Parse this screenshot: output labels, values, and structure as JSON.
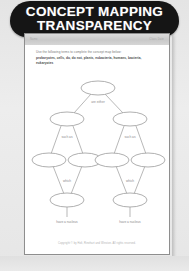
{
  "banner": {
    "title_line1": "CONCEPT MAPPING",
    "title_line2": "TRANSPARENCY"
  },
  "page": {
    "masthead_left": "Name",
    "masthead_right": "Class  Date",
    "instructions": {
      "prompt": "Use the following terms to complete the concept map below:",
      "word_bank": "prokaryotes, cells, do, do not, plants, eubacteria, humans, bacteria, eukaryotes"
    },
    "footer": "Copyright © by Holt, Rinehart and Winston. All rights reserved."
  },
  "concept_map": {
    "type": "hierarchy",
    "nodes": [
      {
        "id": "root",
        "label": "",
        "cx": 69,
        "cy": 12,
        "rx": 17,
        "ry": 7
      },
      {
        "id": "l2a",
        "label": "",
        "cx": 38,
        "cy": 43,
        "rx": 17,
        "ry": 7
      },
      {
        "id": "l2b",
        "label": "",
        "cx": 101,
        "cy": 43,
        "rx": 17,
        "ry": 7
      },
      {
        "id": "l3a",
        "label": "",
        "cx": 20,
        "cy": 84,
        "rx": 17,
        "ry": 7
      },
      {
        "id": "l3b",
        "label": "",
        "cx": 56,
        "cy": 84,
        "rx": 17,
        "ry": 7
      },
      {
        "id": "l3c",
        "label": "",
        "cx": 83,
        "cy": 84,
        "rx": 17,
        "ry": 7
      },
      {
        "id": "l3d",
        "label": "",
        "cx": 119,
        "cy": 84,
        "rx": 17,
        "ry": 7
      },
      {
        "id": "l4a",
        "label": "",
        "cx": 38,
        "cy": 124,
        "rx": 17,
        "ry": 7
      },
      {
        "id": "l4b",
        "label": "",
        "cx": 101,
        "cy": 124,
        "rx": 17,
        "ry": 7
      }
    ],
    "edges": [
      {
        "from": "root",
        "to": "l2a",
        "label": ""
      },
      {
        "from": "root",
        "to": "l2b",
        "label": ""
      },
      {
        "from": "l2a",
        "to": "l3a",
        "label": ""
      },
      {
        "from": "l2a",
        "to": "l3b",
        "label": ""
      },
      {
        "from": "l2b",
        "to": "l3c",
        "label": ""
      },
      {
        "from": "l2b",
        "to": "l3d",
        "label": ""
      },
      {
        "from": "l3a",
        "to": "l4a",
        "label": ""
      },
      {
        "from": "l3b",
        "to": "l4a",
        "label": ""
      },
      {
        "from": "l3c",
        "to": "l4b",
        "label": ""
      },
      {
        "from": "l3d",
        "to": "l4b",
        "label": ""
      }
    ],
    "link_labels": {
      "root_split": "are either",
      "left_such_as": "such as",
      "right_such_as": "such as",
      "left_which": "which",
      "right_which": "which"
    },
    "leaf_captions": {
      "left": "have a nucleus",
      "right": "have a nucleus"
    }
  },
  "colors": {
    "banner_bg": "#151515",
    "banner_text": "#ffffff",
    "page_bg": "#ffffff",
    "page_border": "#8e8e8e",
    "scan_bg": "#e9e9e9",
    "map_stroke": "#9a9a9a",
    "text_muted": "#7a7a7a"
  }
}
